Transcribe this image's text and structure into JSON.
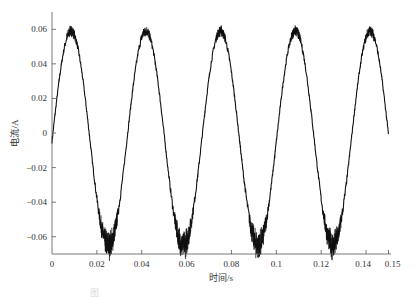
{
  "chart_data": {
    "type": "line",
    "title": "",
    "xlabel": "时间/s",
    "ylabel": "电流/A",
    "xlim": [
      0,
      0.15
    ],
    "ylim": [
      -0.07,
      0.07
    ],
    "x_ticks": [
      0,
      0.02,
      0.04,
      0.06,
      0.08,
      0.1,
      0.12,
      0.14,
      0.15
    ],
    "x_tick_labels": [
      "0",
      "0.02",
      "0.04",
      "0.06",
      "0.08",
      "0.1",
      "0.12",
      "0.14",
      "0.15"
    ],
    "y_ticks": [
      0.06,
      0.04,
      0.02,
      0,
      -0.02,
      -0.04,
      -0.06
    ],
    "y_tick_labels": [
      "0.06",
      "0.04",
      "0.02",
      "0",
      "−0.02",
      "−0.04",
      "−0.06"
    ],
    "grid": false,
    "legend": null,
    "series": [
      {
        "name": "current",
        "color": "#111111",
        "description": "Noisy sinusoidal current, ~30 Hz, amplitude ≈0.06 A (positive) / ≈−0.065 A (negative), with high-frequency ripple near troughs",
        "frequency_hz": 30,
        "offset": -0.003,
        "amplitude": 0.062,
        "peaks": [
          {
            "x": 0.0085,
            "y": 0.059
          },
          {
            "x": 0.042,
            "y": 0.059
          },
          {
            "x": 0.075,
            "y": 0.059
          },
          {
            "x": 0.108,
            "y": 0.059
          },
          {
            "x": 0.142,
            "y": 0.057
          }
        ],
        "troughs": [
          {
            "x": 0.025,
            "y": -0.065
          },
          {
            "x": 0.058,
            "y": -0.064
          },
          {
            "x": 0.092,
            "y": -0.064
          },
          {
            "x": 0.125,
            "y": -0.065
          }
        ],
        "start": {
          "x": 0,
          "y": 0.008
        },
        "end": {
          "x": 0.15,
          "y": 0.0
        }
      }
    ]
  },
  "caption": "图"
}
